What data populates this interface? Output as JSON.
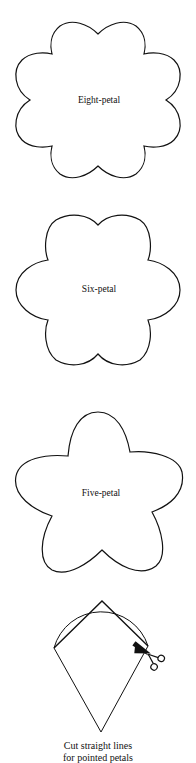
{
  "templates": [
    {
      "id": "eight-petal",
      "label": "Eight-petal",
      "petals": 8
    },
    {
      "id": "six-petal",
      "label": "Six-petal",
      "petals": 6
    },
    {
      "id": "five-petal",
      "label": "Five-petal",
      "petals": 5
    }
  ],
  "instruction": {
    "line1": "Cut straight lines",
    "line2": "for pointed petals"
  },
  "colors": {
    "stroke": "#111111",
    "background": "#ffffff"
  }
}
